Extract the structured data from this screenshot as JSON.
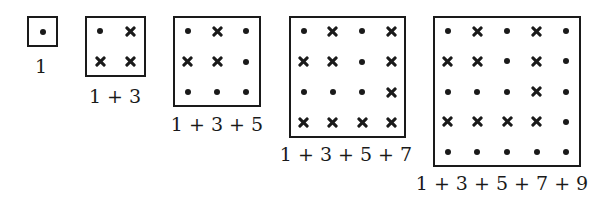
{
  "figures": [
    {
      "label": "1",
      "size": 1,
      "box": {
        "x": 27,
        "y": 16,
        "w": 31,
        "h": 31
      },
      "label_pos": {
        "x": 41,
        "y": 55
      },
      "grid": [
        [
          "dot"
        ]
      ]
    },
    {
      "label": "1 + 3",
      "size": 2,
      "box": {
        "x": 85,
        "y": 16,
        "w": 61,
        "h": 61
      },
      "label_pos": {
        "x": 115,
        "y": 85
      },
      "grid": [
        [
          "dot",
          "cross"
        ],
        [
          "cross",
          "cross"
        ]
      ]
    },
    {
      "label": "1 + 3 + 5",
      "size": 3,
      "box": {
        "x": 173,
        "y": 16,
        "w": 88,
        "h": 91
      },
      "label_pos": {
        "x": 217,
        "y": 113
      },
      "grid": [
        [
          "dot",
          "cross",
          "dot"
        ],
        [
          "cross",
          "cross",
          "dot"
        ],
        [
          "dot",
          "dot",
          "dot"
        ]
      ]
    },
    {
      "label": "1 + 3 + 5 + 7",
      "size": 4,
      "box": {
        "x": 289,
        "y": 16,
        "w": 117,
        "h": 122
      },
      "label_pos": {
        "x": 346,
        "y": 143
      },
      "grid": [
        [
          "dot",
          "cross",
          "dot",
          "cross"
        ],
        [
          "cross",
          "cross",
          "dot",
          "cross"
        ],
        [
          "dot",
          "dot",
          "dot",
          "cross"
        ],
        [
          "cross",
          "cross",
          "cross",
          "cross"
        ]
      ]
    },
    {
      "label": "1 + 3 + 5 + 7 + 9",
      "size": 5,
      "box": {
        "x": 433,
        "y": 16,
        "w": 148,
        "h": 151
      },
      "label_pos": {
        "x": 502,
        "y": 172
      },
      "grid": [
        [
          "dot",
          "cross",
          "dot",
          "cross",
          "dot"
        ],
        [
          "cross",
          "cross",
          "dot",
          "cross",
          "dot"
        ],
        [
          "dot",
          "dot",
          "dot",
          "cross",
          "dot"
        ],
        [
          "cross",
          "cross",
          "cross",
          "cross",
          "dot"
        ],
        [
          "dot",
          "dot",
          "dot",
          "dot",
          "dot"
        ]
      ]
    }
  ],
  "icons": {
    "dot": "dot-icon",
    "cross": "cross-icon"
  }
}
